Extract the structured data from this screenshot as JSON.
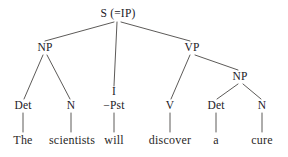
{
  "figure": {
    "kind": "syntax-tree",
    "sentence": "The scientists will discover a cure",
    "background_color": "#ffffff",
    "line_color": "#4a4745",
    "text_color": "#22201f",
    "width": 288,
    "height": 157
  },
  "nodes": {
    "root": {
      "label": "S (=IP)",
      "x": 118,
      "y": 14
    },
    "subject_np": {
      "label": "NP",
      "x": 45,
      "y": 48
    },
    "infl": {
      "label": "I",
      "x": 114,
      "y": 92
    },
    "vp": {
      "label": "VP",
      "x": 192,
      "y": 48
    },
    "object_np": {
      "label": "NP",
      "x": 240,
      "y": 77
    },
    "det1": {
      "label": "Det",
      "x": 23,
      "y": 106
    },
    "n1": {
      "label": "N",
      "x": 71,
      "y": 106
    },
    "pst": {
      "label": "−Pst",
      "x": 114,
      "y": 106
    },
    "v": {
      "label": "V",
      "x": 170,
      "y": 106
    },
    "det2": {
      "label": "Det",
      "x": 216,
      "y": 106
    },
    "n2": {
      "label": "N",
      "x": 262,
      "y": 106
    }
  },
  "terminals": [
    {
      "word": "The",
      "x": 23,
      "y": 140
    },
    {
      "word": "scientists",
      "x": 72,
      "y": 140
    },
    {
      "word": "will",
      "x": 114,
      "y": 140
    },
    {
      "word": "discover",
      "x": 170,
      "y": 140
    },
    {
      "word": "a",
      "x": 216,
      "y": 140
    },
    {
      "word": "cure",
      "x": 262,
      "y": 140
    }
  ],
  "edges": [
    {
      "from": "root",
      "to": "subject_np",
      "x1": 114,
      "y1": 22,
      "x2": 45,
      "y2": 41
    },
    {
      "from": "root",
      "to": "infl",
      "x1": 117,
      "y1": 22,
      "x2": 114,
      "y2": 86
    },
    {
      "from": "root",
      "to": "vp",
      "x1": 121,
      "y1": 22,
      "x2": 190,
      "y2": 41
    },
    {
      "from": "subject_np",
      "to": "det1",
      "x1": 43,
      "y1": 55,
      "x2": 24,
      "y2": 99
    },
    {
      "from": "subject_np",
      "to": "n1",
      "x1": 47,
      "y1": 55,
      "x2": 70,
      "y2": 99
    },
    {
      "from": "vp",
      "to": "v",
      "x1": 190,
      "y1": 55,
      "x2": 171,
      "y2": 99
    },
    {
      "from": "vp",
      "to": "object_np",
      "x1": 195,
      "y1": 55,
      "x2": 238,
      "y2": 70
    },
    {
      "from": "object_np",
      "to": "det2",
      "x1": 238,
      "y1": 84,
      "x2": 217,
      "y2": 99
    },
    {
      "from": "object_np",
      "to": "n2",
      "x1": 243,
      "y1": 84,
      "x2": 261,
      "y2": 99
    },
    {
      "from": "det1",
      "to": "The",
      "x1": 23,
      "y1": 113,
      "x2": 23,
      "y2": 132
    },
    {
      "from": "n1",
      "to": "scientists",
      "x1": 71,
      "y1": 113,
      "x2": 71,
      "y2": 132
    },
    {
      "from": "pst",
      "to": "will",
      "x1": 114,
      "y1": 113,
      "x2": 114,
      "y2": 132
    },
    {
      "from": "v",
      "to": "discover",
      "x1": 170,
      "y1": 113,
      "x2": 170,
      "y2": 132
    },
    {
      "from": "det2",
      "to": "a",
      "x1": 216,
      "y1": 113,
      "x2": 216,
      "y2": 132
    },
    {
      "from": "n2",
      "to": "cure",
      "x1": 262,
      "y1": 113,
      "x2": 262,
      "y2": 132
    }
  ]
}
